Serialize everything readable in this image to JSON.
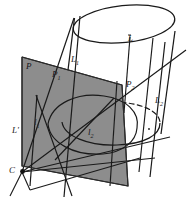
{
  "figure": {
    "background_color": "#ffffff",
    "stroke_color": "#1a1a1a",
    "plane_fill_color": "#8d8d8d",
    "plane_edge_color": "#2a2a2a",
    "dashed_color": "#1a1a1a"
  },
  "labels": {
    "plane": "P",
    "plane_point_1": "P",
    "plane_point_1_sub": "1",
    "plane_point_2": "P",
    "plane_point_2_sub": "2",
    "axis_line": "L",
    "generator_1": "L",
    "generator_1_sub": "1",
    "generator_2": "L",
    "generator_2_sub": "2",
    "trace_line": "L'",
    "ellipse_line_1": "l",
    "ellipse_line_1_sub": "1",
    "ellipse_line_2": "l",
    "ellipse_line_2_sub": "2",
    "apex_point": "C"
  },
  "geometry": {
    "canvas": {
      "width": 187,
      "height": 214
    },
    "cylinder": {
      "top_ellipse": {
        "cx": 124,
        "cy": 23,
        "rx": 51,
        "ry": 18,
        "rotation": -8
      },
      "bottom_ellipse": {
        "cx": 110,
        "cy": 129,
        "rx": 51,
        "ry": 18,
        "rotation": -8
      },
      "left_side_x": 73,
      "right_side_x": 175
    },
    "plane_quad": [
      [
        22,
        57
      ],
      [
        122,
        85
      ],
      [
        128,
        186
      ],
      [
        22,
        166
      ]
    ],
    "apex": {
      "x": 22,
      "y": 172
    }
  }
}
